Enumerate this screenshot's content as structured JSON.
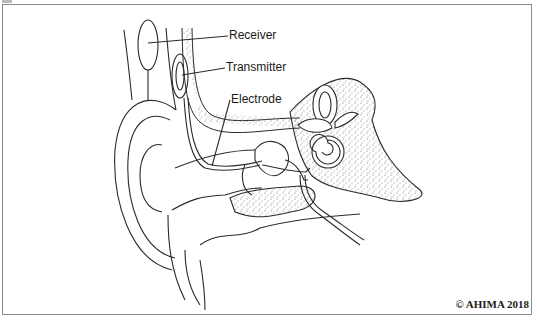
{
  "diagram": {
    "labels": [
      {
        "id": "receiver",
        "text": "Receiver"
      },
      {
        "id": "transmitter",
        "text": "Transmitter"
      },
      {
        "id": "electrode",
        "text": "Electrode"
      }
    ],
    "copyright": "© AHIMA 2018",
    "colors": {
      "line": "#2a2a2a",
      "border": "#8a8a8a",
      "stipple": "#6a6a6a"
    }
  }
}
